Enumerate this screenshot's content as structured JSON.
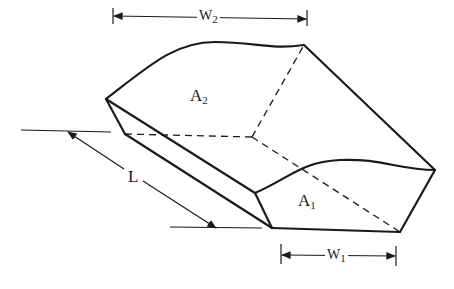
{
  "diagram": {
    "type": "isometric-channel-section",
    "labels": {
      "area_upstream": {
        "main": "A",
        "sub": "2"
      },
      "area_downstream": {
        "main": "A",
        "sub": "1"
      },
      "width_upstream": {
        "main": "W",
        "sub": "2"
      },
      "width_downstream": {
        "main": "W",
        "sub": "1"
      },
      "length": {
        "main": "L"
      }
    },
    "colors": {
      "line": "#1a1a1a",
      "background": "#ffffff"
    }
  }
}
